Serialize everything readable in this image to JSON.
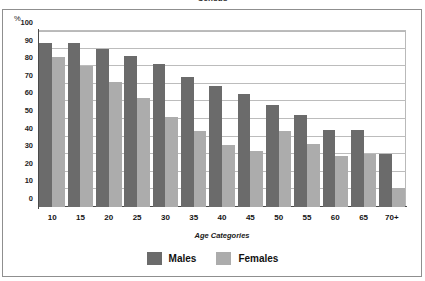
{
  "chart_data": {
    "type": "bar",
    "title": "Census",
    "xlabel": "Age Categories",
    "ylabel": "%",
    "ylim": [
      0,
      100
    ],
    "yticks": [
      0,
      10,
      20,
      30,
      40,
      50,
      60,
      70,
      80,
      90,
      100
    ],
    "grid": true,
    "legend_position": "bottom",
    "categories": [
      "10",
      "15",
      "20",
      "25",
      "30",
      "35",
      "40",
      "45",
      "50",
      "55",
      "60",
      "65",
      "70+"
    ],
    "series": [
      {
        "name": "Males",
        "color": "#6b6b6b",
        "values": [
          93,
          93,
          90,
          86,
          81,
          74,
          69,
          64,
          58,
          52,
          44,
          44,
          30
        ]
      },
      {
        "name": "Females",
        "color": "#acacac",
        "values": [
          85,
          80,
          71,
          62,
          51,
          43,
          35,
          32,
          43,
          36,
          29,
          30,
          11
        ]
      }
    ]
  },
  "axis": {
    "y_unit_label": "%"
  }
}
